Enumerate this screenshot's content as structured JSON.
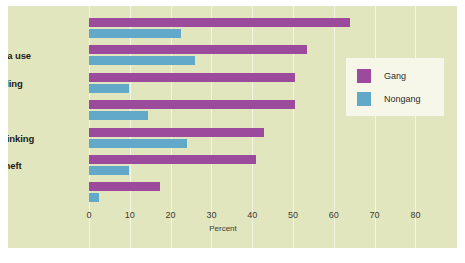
{
  "figure": {
    "top_crop_text": "",
    "background_color": "#e2e6bf",
    "gridline_color": "#f4f6e4"
  },
  "legend": {
    "position": "right-upper",
    "entries": [
      {
        "label": "Gang",
        "color": "#9c4a9c"
      },
      {
        "label": "Nongang",
        "color": "#62a9c9"
      }
    ]
  },
  "axis": {
    "x_title": "Percent",
    "x_ticks": [
      "0",
      "10",
      "20",
      "30",
      "40",
      "50",
      "60",
      "70",
      "80"
    ]
  },
  "chart_data": {
    "type": "bar",
    "orientation": "horizontal",
    "title": "",
    "xlabel": "Percent",
    "ylabel": "",
    "xlim": [
      0,
      87
    ],
    "x_ticks": [
      0,
      10,
      20,
      30,
      40,
      50,
      60,
      70,
      80
    ],
    "grid": true,
    "legend_position": "right-upper",
    "categories": [
      "Assault",
      "Marijuana use",
      "Drug selling",
      "Arrest",
      "Binge drinking",
      "Felony theft",
      "Robbery"
    ],
    "series": [
      {
        "name": "Gang",
        "color": "#9c4a9c",
        "values": [
          64,
          53.5,
          50.5,
          50.5,
          43,
          41,
          17.5
        ]
      },
      {
        "name": "Nongang",
        "color": "#62a9c9",
        "values": [
          22.5,
          26,
          9.8,
          14.4,
          24,
          9.8,
          2.5
        ]
      }
    ]
  }
}
